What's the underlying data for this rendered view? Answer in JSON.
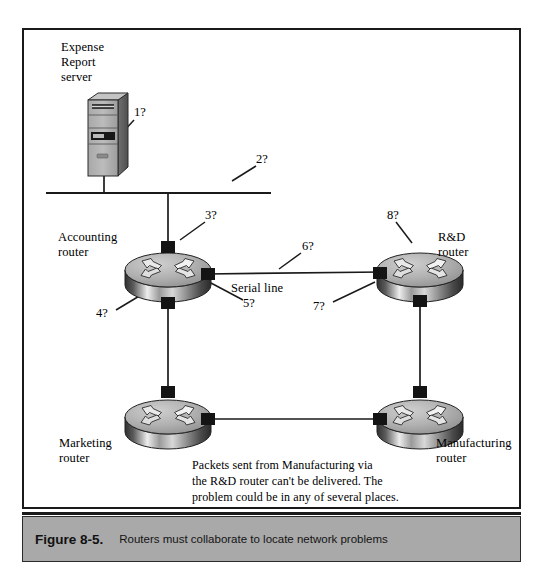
{
  "figure": {
    "caption_number": "Figure 8-5.",
    "caption_text": "Routers must collaborate to locate network problems"
  },
  "diagram": {
    "type": "network-topology",
    "nodes": [
      {
        "id": "server",
        "icon": "server-tower-icon",
        "label": "Expense\nReport\nserver",
        "x": 104,
        "y": 145
      },
      {
        "id": "accounting",
        "icon": "router-icon",
        "label": "Accounting\nrouter",
        "x": 168,
        "y": 272
      },
      {
        "id": "rnd",
        "icon": "router-icon",
        "label": "R&D\nrouter",
        "x": 420,
        "y": 272
      },
      {
        "id": "marketing",
        "icon": "router-icon",
        "label": "Marketing\nrouter",
        "x": 168,
        "y": 417
      },
      {
        "id": "manufacturing",
        "icon": "router-icon",
        "label": "Manufacturing\nrouter",
        "x": 420,
        "y": 417
      }
    ],
    "links": [
      {
        "from": "server",
        "to": "ethernet-bus",
        "kind": "drop"
      },
      {
        "from": "ethernet-bus",
        "to": "accounting",
        "kind": "drop"
      },
      {
        "from": "accounting",
        "to": "rnd",
        "kind": "serial",
        "label": "Serial line"
      },
      {
        "from": "accounting",
        "to": "marketing",
        "kind": "ethernet"
      },
      {
        "from": "rnd",
        "to": "manufacturing",
        "kind": "ethernet"
      },
      {
        "from": "marketing",
        "to": "manufacturing",
        "kind": "ethernet"
      }
    ],
    "segment_label": "Serial line",
    "callouts": [
      {
        "id": "1",
        "label": "1?",
        "x": 137,
        "y": 112
      },
      {
        "id": "2",
        "label": "2?",
        "x": 258,
        "y": 160
      },
      {
        "id": "3",
        "label": "3?",
        "x": 208,
        "y": 215
      },
      {
        "id": "4",
        "label": "4?",
        "x": 99,
        "y": 312
      },
      {
        "id": "5",
        "label": "5?",
        "x": 244,
        "y": 303
      },
      {
        "id": "6",
        "label": "6?",
        "x": 303,
        "y": 246
      },
      {
        "id": "7",
        "label": "7?",
        "x": 314,
        "y": 305
      },
      {
        "id": "8",
        "label": "8?",
        "x": 390,
        "y": 215
      }
    ],
    "note": "Packets sent from Manufacturing via\nthe R&D router can't be delivered. The\nproblem could be in any of several places."
  },
  "colors": {
    "line": "#1a1a1a",
    "frame": "#1a1a1a",
    "caption_bar": "#a9a9a9",
    "router_top": "#b6b6b6",
    "router_side_dark": "#3d3d3d",
    "router_side_light": "#f0f0f0",
    "connector": "#141414",
    "server_body": "#9a9a9a"
  }
}
